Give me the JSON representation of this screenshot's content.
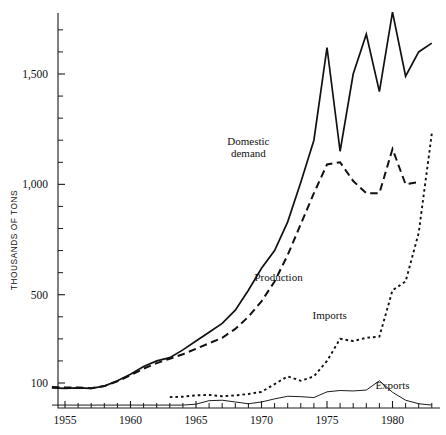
{
  "chart_data": {
    "type": "line",
    "title": "",
    "xlabel": "",
    "ylabel": "THOUSANDS OF TONS",
    "xlim": [
      1954,
      1983
    ],
    "ylim": [
      0,
      1800
    ],
    "grid": false,
    "legend_position": "inline-annotations",
    "x_tick_labels": [
      "1955",
      "1960",
      "1965",
      "1970",
      "1975",
      "1980"
    ],
    "x_tick_values": [
      1955,
      1960,
      1965,
      1970,
      1975,
      1980
    ],
    "y_tick_labels": [
      "100",
      "500",
      "1,000",
      "1,500"
    ],
    "y_tick_values": [
      100,
      500,
      1000,
      1500
    ],
    "x": [
      1954,
      1955,
      1956,
      1957,
      1958,
      1959,
      1960,
      1961,
      1962,
      1963,
      1964,
      1965,
      1966,
      1967,
      1968,
      1969,
      1970,
      1971,
      1972,
      1973,
      1974,
      1975,
      1976,
      1977,
      1978,
      1979,
      1980,
      1981,
      1982,
      1983
    ],
    "series": [
      {
        "name": "Domestic demand",
        "style": "solid",
        "label_position": {
          "x": 1969.0,
          "y": 1180
        },
        "values": [
          78,
          76,
          78,
          76,
          86,
          110,
          140,
          175,
          200,
          215,
          250,
          290,
          330,
          370,
          430,
          520,
          620,
          700,
          830,
          1010,
          1200,
          1620,
          1150,
          1500,
          1680,
          1420,
          1780,
          1490,
          1600,
          1640
        ]
      },
      {
        "name": "Production",
        "style": "dashed",
        "label_position": {
          "x": 1971.3,
          "y": 560
        },
        "values": [
          82,
          80,
          80,
          76,
          86,
          108,
          135,
          165,
          190,
          210,
          230,
          255,
          280,
          305,
          345,
          400,
          470,
          560,
          680,
          820,
          960,
          1090,
          1100,
          1015,
          960,
          960,
          1160,
          1000,
          1010,
          990
        ]
      },
      {
        "name": "Imports",
        "style": "dotted",
        "label_position": {
          "x": 1975.2,
          "y": 390
        },
        "values": [
          20,
          18,
          22,
          20,
          38,
          40,
          42,
          48,
          40,
          36,
          38,
          44,
          46,
          40,
          44,
          50,
          60,
          95,
          130,
          110,
          130,
          200,
          300,
          290,
          305,
          310,
          520,
          560,
          780,
          1230
        ]
      },
      {
        "name": "Exports",
        "style": "thin-solid",
        "label_position": {
          "x": 1980.0,
          "y": 72
        },
        "values": [
          0,
          0,
          0,
          0,
          0,
          0,
          0,
          0,
          0,
          0,
          0,
          4,
          20,
          22,
          14,
          6,
          14,
          28,
          40,
          38,
          34,
          60,
          66,
          64,
          68,
          110,
          58,
          22,
          6,
          0
        ]
      }
    ]
  },
  "notes": {
    "imports_start_year": 1963,
    "production_end_year": 1982,
    "imports_end_year": 1983
  }
}
